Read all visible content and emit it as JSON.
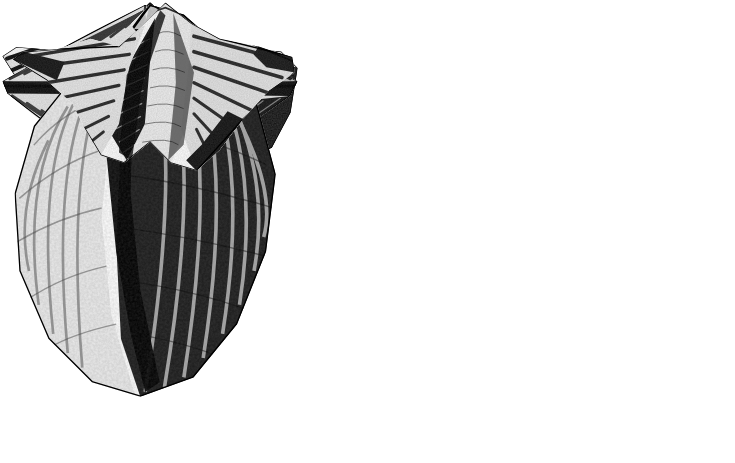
{
  "plate": {
    "title": "Fossil brachiopod specimen plate",
    "medium": "halftone engraving",
    "background_color": "#ffffff",
    "ink_color": "#111111",
    "width": 735,
    "height": 463,
    "figure_count": 5
  },
  "figures": [
    {
      "id": "fig-1",
      "name": "brachial-valve-dorsal-view",
      "view_label": "dorsal view",
      "description": "Wide fan-shaped shell with straight hinge line, pointed beak at top, radiating ribs and a pale median sulcus running to the front margin.",
      "bounds": {
        "x": 78,
        "y": 28,
        "w": 254,
        "h": 175
      },
      "rib_count": 34,
      "has_median_sulcus": true,
      "has_median_fold": false,
      "has_interarea": true
    },
    {
      "id": "fig-2",
      "name": "pedicle-valve-ventral-view",
      "view_label": "ventral view",
      "description": "Fan-shaped shell with a strong raised median fold from beak to front margin, radiating ribs, dark shaded right wing and pointed alate extremities.",
      "bounds": {
        "x": 388,
        "y": 32,
        "w": 256,
        "h": 168
      },
      "rib_count": 30,
      "has_median_sulcus": false,
      "has_median_fold": true,
      "has_interarea": false
    },
    {
      "id": "fig-3",
      "name": "anterior-commissure-view",
      "view_label": "anterior view",
      "description": "Rhomboid outline seen from the front showing the zig-zag commissure line across the middle, both valves with radiating ribs meeting at the hinge extremities.",
      "bounds": {
        "x": 14,
        "y": 294,
        "w": 244,
        "h": 152
      },
      "rib_count": 26,
      "has_median_sulcus": true,
      "has_median_fold": true,
      "has_interarea": false
    },
    {
      "id": "fig-4",
      "name": "lateral-side-view",
      "view_label": "lateral view",
      "description": "Narrow side profile of the closed shell, pale valve on the left and dark ribbed valve on the right, beak notch at the top.",
      "bounds": {
        "x": 293,
        "y": 290,
        "w": 124,
        "h": 166
      },
      "rib_count": 20,
      "has_median_sulcus": false,
      "has_median_fold": false,
      "has_interarea": false
    },
    {
      "id": "fig-5",
      "name": "posterior-cardinal-view",
      "view_label": "posterior view",
      "description": "View onto the hinge showing the triangular interarea, a deep central depression flanked by raised folds, and long pointed cardinal extremities.",
      "bounds": {
        "x": 484,
        "y": 290,
        "w": 232,
        "h": 150
      },
      "rib_count": 22,
      "has_median_sulcus": true,
      "has_median_fold": true,
      "has_interarea": true
    }
  ]
}
